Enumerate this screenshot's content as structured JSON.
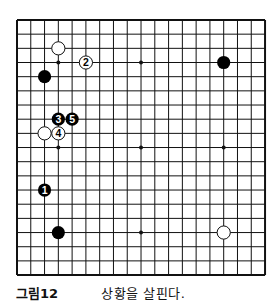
{
  "figure": {
    "label": "그림12",
    "caption": "상황을 살핀다."
  },
  "board": {
    "size": 19,
    "origin": {
      "x": 17,
      "y": 20
    },
    "spacing": {
      "x": 13.78,
      "y": 14.17
    },
    "hoshi": [
      [
        3,
        3
      ],
      [
        9,
        3
      ],
      [
        15,
        3
      ],
      [
        3,
        9
      ],
      [
        9,
        9
      ],
      [
        15,
        9
      ],
      [
        3,
        15
      ],
      [
        9,
        15
      ],
      [
        15,
        15
      ]
    ],
    "stones": [
      {
        "color": "white",
        "col": 3,
        "row": 2,
        "label": ""
      },
      {
        "color": "white",
        "col": 5,
        "row": 3,
        "label": "2"
      },
      {
        "color": "black",
        "col": 15,
        "row": 3,
        "label": ""
      },
      {
        "color": "black",
        "col": 2,
        "row": 4,
        "label": ""
      },
      {
        "color": "black",
        "col": 3,
        "row": 7,
        "label": "3"
      },
      {
        "color": "black",
        "col": 4,
        "row": 7,
        "label": "5"
      },
      {
        "color": "white",
        "col": 2,
        "row": 8,
        "label": ""
      },
      {
        "color": "white",
        "col": 3,
        "row": 8,
        "label": "4"
      },
      {
        "color": "black",
        "col": 2,
        "row": 12,
        "label": "1"
      },
      {
        "color": "black",
        "col": 3,
        "row": 15,
        "label": ""
      },
      {
        "color": "white",
        "col": 15,
        "row": 15,
        "label": ""
      }
    ]
  }
}
